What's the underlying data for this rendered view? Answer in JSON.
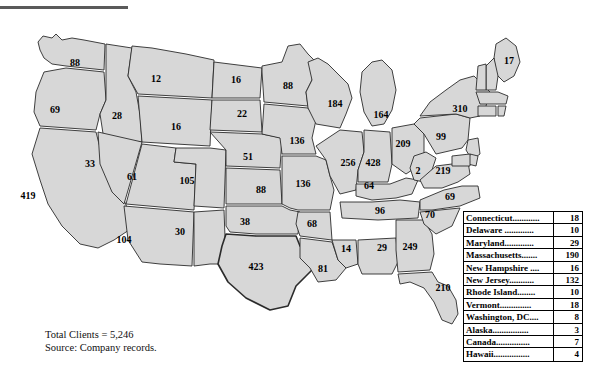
{
  "figure": {
    "footnote_total": "Total Clients = 5,246",
    "footnote_source": "Source: Company records."
  },
  "legend_table": {
    "rows": [
      {
        "name": "Connecticut............",
        "value": "18"
      },
      {
        "name": "Delaware .............",
        "value": "10"
      },
      {
        "name": "Maryland.............",
        "value": "29"
      },
      {
        "name": "Massachusetts.......",
        "value": "190"
      },
      {
        "name": "New Hampshire ....",
        "value": "16"
      },
      {
        "name": "New Jersey...........",
        "value": "132"
      },
      {
        "name": "Rhode Island........",
        "value": "10"
      },
      {
        "name": "Vermont..............",
        "value": "18"
      },
      {
        "name": "Washington, DC....",
        "value": "8"
      },
      {
        "name": "Alaska................",
        "value": "3"
      },
      {
        "name": "Canada...............",
        "value": "7"
      },
      {
        "name": "Hawaii................",
        "value": "4"
      }
    ]
  },
  "chart_data": {
    "type": "map",
    "title": "",
    "subtitle": "",
    "value_label": "Clients",
    "total": 5246,
    "source": "Company records.",
    "region_fill": "#d7d7d7",
    "region_stroke": "#2b2b2b",
    "map_labels": [
      {
        "id": "WA",
        "name": "Washington",
        "value": 88,
        "x": 75,
        "y": 50
      },
      {
        "id": "OR",
        "name": "Oregon",
        "value": 69,
        "x": 55,
        "y": 97
      },
      {
        "id": "CA",
        "name": "California",
        "value": 419,
        "x": 28,
        "y": 183
      },
      {
        "id": "ID",
        "name": "Idaho",
        "value": 28,
        "x": 117,
        "y": 103
      },
      {
        "id": "NV",
        "name": "Nevada",
        "value": 33,
        "x": 90,
        "y": 151
      },
      {
        "id": "UT",
        "name": "Utah",
        "value": 61,
        "x": 132,
        "y": 164
      },
      {
        "id": "AZ",
        "name": "Arizona",
        "value": 104,
        "x": 124,
        "y": 227
      },
      {
        "id": "MT",
        "name": "Montana",
        "value": 12,
        "x": 156,
        "y": 66
      },
      {
        "id": "WY",
        "name": "Wyoming",
        "value": 16,
        "x": 176,
        "y": 114
      },
      {
        "id": "CO",
        "name": "Colorado",
        "value": 105,
        "x": 187,
        "y": 168
      },
      {
        "id": "NM",
        "name": "New Mexico",
        "value": 30,
        "x": 180,
        "y": 219
      },
      {
        "id": "ND",
        "name": "North Dakota",
        "value": 16,
        "x": 236,
        "y": 67
      },
      {
        "id": "SD",
        "name": "South Dakota",
        "value": 22,
        "x": 242,
        "y": 101
      },
      {
        "id": "NE",
        "name": "Nebraska",
        "value": 51,
        "x": 248,
        "y": 144
      },
      {
        "id": "KS",
        "name": "Kansas",
        "value": 88,
        "x": 261,
        "y": 177
      },
      {
        "id": "OK",
        "name": "Oklahoma",
        "value": 38,
        "x": 245,
        "y": 209
      },
      {
        "id": "TX",
        "name": "Texas",
        "value": 423,
        "x": 256,
        "y": 254
      },
      {
        "id": "MN",
        "name": "Minnesota",
        "value": 88,
        "x": 288,
        "y": 73
      },
      {
        "id": "IA",
        "name": "Iowa",
        "value": 136,
        "x": 297,
        "y": 128
      },
      {
        "id": "MO",
        "name": "Missouri",
        "value": 136,
        "x": 303,
        "y": 171
      },
      {
        "id": "AR",
        "name": "Arkansas",
        "value": 68,
        "x": 312,
        "y": 211
      },
      {
        "id": "LA",
        "name": "Louisiana",
        "value": 81,
        "x": 323,
        "y": 256
      },
      {
        "id": "WI",
        "name": "Wisconsin",
        "value": 184,
        "x": 335,
        "y": 91
      },
      {
        "id": "IL",
        "name": "Illinois",
        "value": 256,
        "x": 348,
        "y": 150
      },
      {
        "id": "MS",
        "name": "Mississippi",
        "value": 14,
        "x": 346,
        "y": 236
      },
      {
        "id": "MI",
        "name": "Michigan",
        "value": 164,
        "x": 381,
        "y": 102
      },
      {
        "id": "IN",
        "name": "Indiana",
        "value": 428,
        "x": 373,
        "y": 150
      },
      {
        "id": "KY",
        "name": "Kentucky",
        "value": 64,
        "x": 369,
        "y": 173
      },
      {
        "id": "TN",
        "name": "Tennessee",
        "value": 96,
        "x": 380,
        "y": 198
      },
      {
        "id": "AL",
        "name": "Alabama",
        "value": 29,
        "x": 382,
        "y": 235
      },
      {
        "id": "OH",
        "name": "Ohio",
        "value": 209,
        "x": 403,
        "y": 131
      },
      {
        "id": "GA",
        "name": "Georgia",
        "value": 249,
        "x": 410,
        "y": 234
      },
      {
        "id": "FL",
        "name": "Florida",
        "value": 210,
        "x": 443,
        "y": 275
      },
      {
        "id": "WV",
        "name": "West Virginia",
        "value": 2,
        "x": 418,
        "y": 158
      },
      {
        "id": "SC",
        "name": "South Carolina",
        "value": 70,
        "x": 430,
        "y": 202
      },
      {
        "id": "NC",
        "name": "North Carolina",
        "value": 69,
        "x": 450,
        "y": 184
      },
      {
        "id": "VA",
        "name": "Virginia",
        "value": 219,
        "x": 443,
        "y": 158
      },
      {
        "id": "PA",
        "name": "Pennsylvania",
        "value": 99,
        "x": 441,
        "y": 124
      },
      {
        "id": "NY",
        "name": "New York",
        "value": 310,
        "x": 460,
        "y": 96
      },
      {
        "id": "ME",
        "name": "Maine",
        "value": 17,
        "x": 509,
        "y": 48
      }
    ],
    "table_entries": [
      {
        "name": "Connecticut",
        "value": 18
      },
      {
        "name": "Delaware",
        "value": 10
      },
      {
        "name": "Maryland",
        "value": 29
      },
      {
        "name": "Massachusetts",
        "value": 190
      },
      {
        "name": "New Hampshire",
        "value": 16
      },
      {
        "name": "New Jersey",
        "value": 132
      },
      {
        "name": "Rhode Island",
        "value": 10
      },
      {
        "name": "Vermont",
        "value": 18
      },
      {
        "name": "Washington, DC",
        "value": 8
      },
      {
        "name": "Alaska",
        "value": 3
      },
      {
        "name": "Canada",
        "value": 7
      },
      {
        "name": "Hawaii",
        "value": 4
      }
    ]
  }
}
